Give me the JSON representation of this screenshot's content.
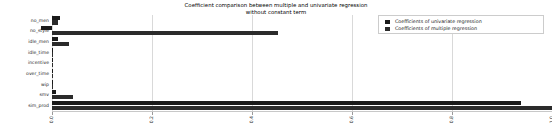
{
  "chart_data": {
    "type": "bar",
    "orientation": "horizontal",
    "title": "Coefficient comparison between multiple and univariate regression",
    "subtitle": "without constant term",
    "xlabel": "",
    "ylabel": "",
    "xlim": [
      0.0,
      1.0
    ],
    "xticks": [
      "0.0",
      "0.2",
      "0.4",
      "0.6",
      "0.8",
      "1.0"
    ],
    "xtick_values": [
      0.0,
      0.2,
      0.4,
      0.6,
      0.8,
      1.0
    ],
    "grid": true,
    "legend_position": "upper right",
    "categories": [
      "no_men",
      "no_style",
      "idle_men",
      "idle_time",
      "incentive",
      "over_time",
      "wip",
      "smv",
      "sim_prod"
    ],
    "series": [
      {
        "name": "Coefficients of univariate regression",
        "color": "#1a1a1a",
        "values": [
          0.016,
          -0.022,
          0.012,
          0.001,
          0.001,
          0.0005,
          0.0004,
          0.008,
          0.938
        ]
      },
      {
        "name": "Coefficients of multiple regression",
        "color": "#2b2b2b",
        "values": [
          0.011,
          0.452,
          0.033,
          0.0009,
          0.0008,
          0.0004,
          0.0003,
          0.041,
          1.0
        ]
      }
    ]
  },
  "legend": {
    "items": [
      {
        "label": "Coefficients of univariate regression"
      },
      {
        "label": "Coefficients of multiple regression"
      }
    ]
  }
}
